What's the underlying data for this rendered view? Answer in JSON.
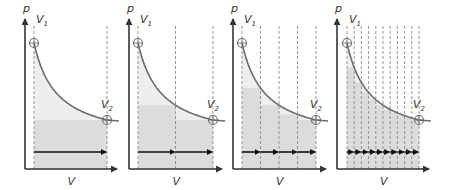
{
  "figure": {
    "axis_labels": {
      "y": "p",
      "x": "V"
    },
    "point_labels": {
      "start": "V",
      "start_sub": "1",
      "end": "V",
      "end_sub": "2"
    },
    "colors": {
      "axis": "#333333",
      "curve": "#6b6b6b",
      "dashed": "#8a8a8a",
      "area_under_curve": "#eeeeee",
      "step_rectangles": "#dcdcdc",
      "arrow": "#111111"
    },
    "panels": [
      {
        "name": "panel-1-step",
        "steps": 1,
        "origin_x": 25,
        "v1_x": 34,
        "v2_x": 107,
        "axis_end_x": 121
      },
      {
        "name": "panel-2-steps",
        "steps": 2,
        "origin_x": 129,
        "v1_x": 138,
        "v2_x": 213,
        "axis_end_x": 226
      },
      {
        "name": "panel-4-steps",
        "steps": 4,
        "origin_x": 233,
        "v1_x": 242,
        "v2_x": 316,
        "axis_end_x": 330
      },
      {
        "name": "panel-10-steps",
        "steps": 10,
        "origin_x": 337,
        "v1_x": 347,
        "v2_x": 419,
        "axis_end_x": 433
      }
    ],
    "geometry": {
      "axis_y": 169,
      "axis_top": 15,
      "p1_y": 43,
      "p2_y": 120,
      "arrow_y": 152
    }
  }
}
